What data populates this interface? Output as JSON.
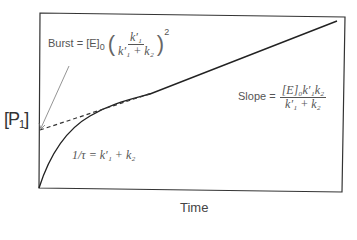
{
  "diagram": {
    "type": "kinetic-burst-plot",
    "y_axis_label": {
      "main": "P",
      "sub": "1"
    },
    "x_axis_label": "Time",
    "annotations": {
      "burst": {
        "prefix": "Burst = [E]",
        "sub": "0",
        "numerator": "k′₁",
        "denominator": "k′₁ + k₂",
        "exponent": "2"
      },
      "slope": {
        "prefix": "Slope =",
        "numerator": "[E]₀k′₁k₂",
        "denominator": "k′₁ + k₂"
      },
      "tau": {
        "text": "1/τ = k′₁ + k₂"
      }
    },
    "colors": {
      "line": "#222222",
      "frame": "#333333",
      "text": "#555555",
      "background": "#ffffff"
    }
  }
}
